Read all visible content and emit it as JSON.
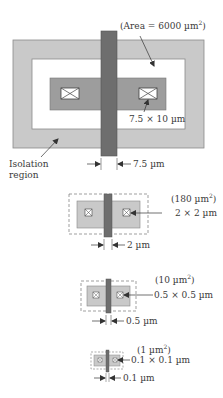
{
  "colors": {
    "isolation": "#c9c9c9",
    "active": "#9d9d9d",
    "gate": "#6e6e6e",
    "contact": "#ffffff",
    "outline": "#7a7a7a",
    "background": "#ffffff"
  },
  "devices": [
    {
      "id": "large",
      "area_label": "(Area = 6000 µm",
      "area_sup": "2",
      "area_close": ")",
      "contact_label": "7.5 × 10 µm",
      "gate_label": "7.5 µm",
      "isolation_label_line1": "Isolation",
      "isolation_label_line2": "region"
    },
    {
      "id": "medium",
      "area_label": "(180 µm",
      "area_sup": "2",
      "area_close": ")",
      "contact_label": "2 × 2 µm",
      "gate_label": "2 µm"
    },
    {
      "id": "small",
      "area_label": "(10 µm",
      "area_sup": "2",
      "area_close": ")",
      "contact_label": "0.5 × 0.5 µm",
      "gate_label": "0.5 µm"
    },
    {
      "id": "tiny",
      "area_label": "(1 µm",
      "area_sup": "2",
      "area_close": ")",
      "contact_label": "0.1 × 0.1 µm",
      "gate_label": "0.1 µm"
    }
  ]
}
